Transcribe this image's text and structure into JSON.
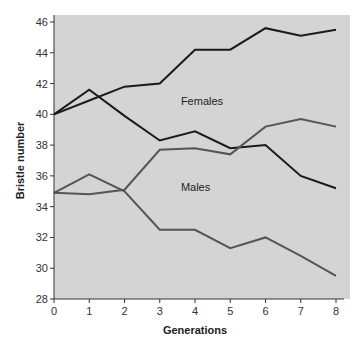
{
  "chart_data": {
    "type": "line",
    "title": "",
    "xlabel": "Generations",
    "ylabel": "Bristle number",
    "x": [
      0,
      1,
      2,
      3,
      4,
      5,
      6,
      7,
      8
    ],
    "xlim": [
      0,
      8
    ],
    "ylim": [
      28,
      46
    ],
    "yticks": [
      28,
      30,
      32,
      34,
      36,
      38,
      40,
      42,
      44,
      46
    ],
    "xticks": [
      0,
      1,
      2,
      3,
      4,
      5,
      6,
      7,
      8
    ],
    "grid": false,
    "legend": "none",
    "annotations": [
      {
        "text": "Females",
        "x": 3.6,
        "y": 40.6
      },
      {
        "text": "Males",
        "x": 3.6,
        "y": 35.0
      }
    ],
    "series": [
      {
        "name": "Females (selected up)",
        "color": "#1a1a1a",
        "values": [
          40.0,
          40.9,
          41.8,
          42.0,
          44.2,
          44.2,
          45.6,
          45.1,
          45.5
        ]
      },
      {
        "name": "Females (selected down)",
        "color": "#1a1a1a",
        "values": [
          40.0,
          41.6,
          39.9,
          38.3,
          38.9,
          37.8,
          38.0,
          36.0,
          35.2
        ]
      },
      {
        "name": "Males (selected up)",
        "color": "#555555",
        "values": [
          34.9,
          34.8,
          35.1,
          37.7,
          37.8,
          37.4,
          39.2,
          39.7,
          39.2
        ]
      },
      {
        "name": "Males (selected down)",
        "color": "#555555",
        "values": [
          34.9,
          36.1,
          35.0,
          32.5,
          32.5,
          31.3,
          32.0,
          30.8,
          29.5
        ]
      }
    ],
    "plot_background": "#d4d4d4"
  }
}
